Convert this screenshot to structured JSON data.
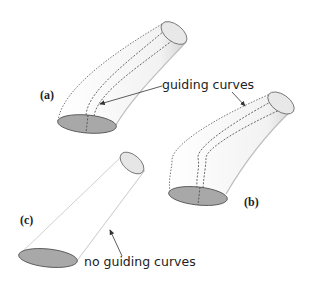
{
  "figure": {
    "panels": [
      {
        "id": "a",
        "label": "(a)",
        "description": "swept surface with guiding curves"
      },
      {
        "id": "b",
        "label": "(b)",
        "description": "swept surface with wavy guiding curves"
      },
      {
        "id": "c",
        "label": "(c)",
        "description": "straight surface, no guiding curves"
      }
    ],
    "annotations": {
      "guiding": "guiding curves",
      "none": "no guiding curves"
    },
    "colors": {
      "base_fill": "#a8a8a8",
      "top_fill": "#e6e6e6",
      "outline": "#555555",
      "guide": "#444444",
      "surface_shade": "#e8e8e8"
    }
  }
}
